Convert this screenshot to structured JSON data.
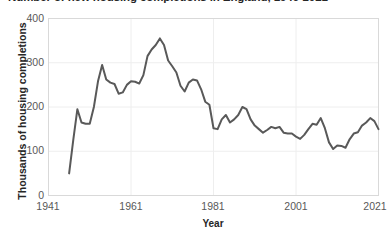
{
  "chart_data": {
    "type": "line",
    "title": "Number of new housing completions in England, 1946-2021",
    "xlabel": "Year",
    "ylabel": "Thousands of housing completions",
    "xlim": [
      1941,
      2021
    ],
    "ylim": [
      0,
      400
    ],
    "x_ticks": [
      "1941",
      "1961",
      "1981",
      "2001",
      "2021"
    ],
    "x_tick_values": [
      1941,
      1961,
      1981,
      2001,
      2021
    ],
    "y_ticks": [
      "0",
      "100",
      "200",
      "300",
      "400"
    ],
    "y_tick_values": [
      0,
      100,
      200,
      300,
      400
    ],
    "grid": "horizontal-and-vertical-light",
    "legend": "none",
    "series": [
      {
        "name": "Housing completions",
        "color": "#595959",
        "x": [
          1946,
          1947,
          1948,
          1949,
          1950,
          1951,
          1952,
          1953,
          1954,
          1955,
          1956,
          1957,
          1958,
          1959,
          1960,
          1961,
          1962,
          1963,
          1964,
          1965,
          1966,
          1967,
          1968,
          1969,
          1970,
          1971,
          1972,
          1973,
          1974,
          1975,
          1976,
          1977,
          1978,
          1979,
          1980,
          1981,
          1982,
          1983,
          1984,
          1985,
          1986,
          1987,
          1988,
          1989,
          1990,
          1991,
          1992,
          1993,
          1994,
          1995,
          1996,
          1997,
          1998,
          1999,
          2000,
          2001,
          2002,
          2003,
          2004,
          2005,
          2006,
          2007,
          2008,
          2009,
          2010,
          2011,
          2012,
          2013,
          2014,
          2015,
          2016,
          2017,
          2018,
          2019,
          2020,
          2021
        ],
        "y": [
          50,
          125,
          195,
          165,
          162,
          162,
          200,
          258,
          295,
          262,
          255,
          252,
          230,
          233,
          250,
          258,
          257,
          253,
          272,
          315,
          330,
          340,
          355,
          340,
          305,
          292,
          278,
          248,
          235,
          255,
          262,
          260,
          240,
          212,
          205,
          152,
          150,
          172,
          182,
          165,
          172,
          182,
          200,
          195,
          172,
          158,
          150,
          142,
          148,
          155,
          152,
          155,
          142,
          140,
          140,
          133,
          128,
          137,
          150,
          162,
          160,
          175,
          152,
          120,
          105,
          113,
          112,
          108,
          127,
          140,
          143,
          158,
          165,
          175,
          168,
          150
        ]
      }
    ]
  },
  "axis": {
    "x_title": "Year",
    "y_title": "Thousands of housing completions"
  }
}
